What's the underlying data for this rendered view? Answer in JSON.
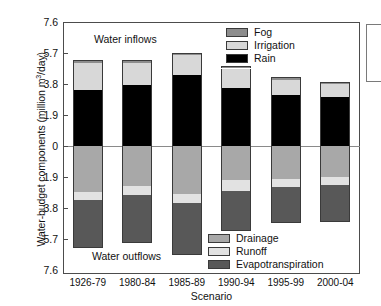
{
  "chart_data": {
    "type": "bar",
    "title": "",
    "xlabel": "Scenario",
    "ylabel": "Water-budget components (million m3/day)",
    "ylabel_html": "Water-budget components (million m<sup>3</sup>/day)",
    "categories": [
      "1926-79",
      "1980-84",
      "1985-89",
      "1990-94",
      "1995-99",
      "2000-04"
    ],
    "ylim": [
      -7.6,
      7.6
    ],
    "ytick_values": [
      7.6,
      5.7,
      3.8,
      1.9,
      0,
      -1.9,
      -3.8,
      -5.7,
      -7.6
    ],
    "ytick_labels": [
      "7.6",
      "5.7",
      "3.8",
      "1.9",
      "0",
      "1.9",
      "3.8",
      "5.7",
      "7.6"
    ],
    "grid": false,
    "stacked": true,
    "orientation": "vertical",
    "annotations": [
      "Water inflows",
      "Water outflows"
    ],
    "series": [
      {
        "name": "Rain",
        "group": "inflow",
        "color": "#000000",
        "values": [
          3.45,
          3.75,
          4.35,
          3.55,
          3.1,
          3.0
        ]
      },
      {
        "name": "Irrigation",
        "group": "inflow",
        "color": "#d8d8d8",
        "values": [
          1.65,
          1.35,
          1.2,
          1.2,
          0.95,
          0.8
        ]
      },
      {
        "name": "Fog",
        "group": "inflow",
        "color": "#8d8d8d",
        "values": [
          0.2,
          0.15,
          0.15,
          0.15,
          0.15,
          0.15
        ]
      },
      {
        "name": "Drainage",
        "group": "outflow",
        "color": "#a8a8a8",
        "values": [
          -2.8,
          -2.45,
          -2.95,
          -2.1,
          -2.0,
          -1.9
        ]
      },
      {
        "name": "Runoff",
        "group": "outflow",
        "color": "#e2e2e2",
        "values": [
          -0.5,
          -0.55,
          -0.55,
          -0.65,
          -0.5,
          -0.5
        ]
      },
      {
        "name": "Evapotranspiration",
        "group": "outflow",
        "color": "#585858",
        "values": [
          -2.95,
          -2.95,
          -3.2,
          -2.45,
          -2.25,
          -2.25
        ]
      }
    ],
    "inflow_totals": [
      5.3,
      5.25,
      5.7,
      4.9,
      4.2,
      3.95
    ],
    "outflow_totals": [
      -6.25,
      -5.95,
      -6.7,
      -5.2,
      -4.75,
      -4.65
    ]
  },
  "legend_inflow": {
    "position": "top-right",
    "items": [
      {
        "label": "Fog",
        "color": "#8d8d8d",
        "swatch_class": "c-fog"
      },
      {
        "label": "Irrigation",
        "color": "#d8d8d8",
        "swatch_class": "c-irrigation"
      },
      {
        "label": "Rain",
        "color": "#000000",
        "swatch_class": "c-rain"
      }
    ]
  },
  "legend_outflow": {
    "position": "bottom-right",
    "items": [
      {
        "label": "Drainage",
        "color": "#a8a8a8",
        "swatch_class": "c-drainage"
      },
      {
        "label": "Runoff",
        "color": "#e2e2e2",
        "swatch_class": "c-runoff"
      },
      {
        "label": "Evapotranspiration",
        "color": "#585858",
        "swatch_class": "c-evap"
      }
    ]
  },
  "annotations": {
    "inflow": "Water inflows",
    "outflow": "Water outflows"
  }
}
